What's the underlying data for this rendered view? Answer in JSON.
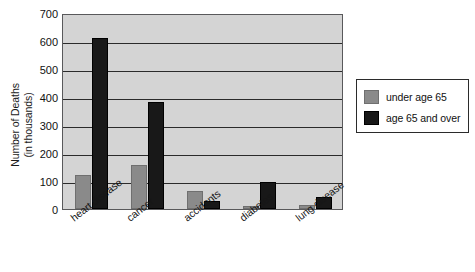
{
  "chart_data": {
    "type": "bar",
    "title": "",
    "xlabel": "",
    "ylabel": "Number of Deaths (in thousands)",
    "ylabel_line1": "Number of Deaths",
    "ylabel_line2": "(in thousands)",
    "categories": [
      "heart disease",
      "cancer",
      "accidents",
      "diabetes",
      "lung disease"
    ],
    "series": [
      {
        "name": "under age 65",
        "color": "#8a8a8a",
        "values": [
          122,
          158,
          65,
          12,
          15
        ]
      },
      {
        "name": "age 65 and over",
        "color": "#181818",
        "values": [
          610,
          383,
          30,
          95,
          42
        ]
      }
    ],
    "ylim": [
      0,
      700
    ],
    "yticks": [
      0,
      100,
      200,
      300,
      400,
      500,
      600,
      700
    ],
    "ytick_labels": [
      "0",
      "100",
      "200",
      "300",
      "400",
      "500",
      "600",
      "700"
    ],
    "grid": true,
    "legend_position": "right",
    "plot_background": "#d4d4d4"
  },
  "legend": {
    "items": [
      {
        "label": "under age 65"
      },
      {
        "label": "age 65 and over"
      }
    ]
  }
}
